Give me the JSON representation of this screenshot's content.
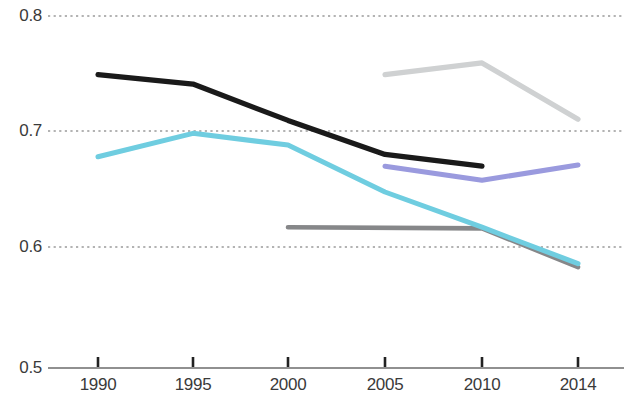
{
  "chart_data": {
    "type": "line",
    "title": "",
    "subtitle": "",
    "xlabel": "",
    "ylabel": "",
    "x": [
      1990,
      1995,
      2000,
      2005,
      2010,
      2014
    ],
    "categories": [
      "1990",
      "1995",
      "2000",
      "2005",
      "2010",
      "2014"
    ],
    "ylim": [
      0.5,
      0.8
    ],
    "xlim": [
      1990,
      2014
    ],
    "ytick_labels": [
      "0.8",
      "0.7",
      "0.6",
      "0.5"
    ],
    "ytick_values": [
      0.8,
      0.7,
      0.6,
      0.5
    ],
    "xtick_labels": [
      "1990",
      "1995",
      "2000",
      "2005",
      "2010",
      "2014"
    ],
    "grid": "horizontal-dotted",
    "gridlines_at": [
      0.8,
      0.7,
      0.6
    ],
    "legend": "none",
    "legend_position": "none",
    "annotations": [],
    "series": [
      {
        "name": "black-series",
        "color": "#1a1a1a",
        "x": [
          1990,
          1995,
          2000,
          2005,
          2010
        ],
        "values": [
          0.75,
          0.742,
          0.711,
          0.682,
          0.672
        ]
      },
      {
        "name": "cyan-series",
        "color": "#6fcde0",
        "x": [
          1990,
          1995,
          2000,
          2005,
          2010,
          2014
        ],
        "values": [
          0.68,
          0.7,
          0.69,
          0.65,
          0.62,
          0.589
        ]
      },
      {
        "name": "light-gray-series",
        "color": "#cfd1d2",
        "x": [
          2005,
          2010,
          2014
        ],
        "values": [
          0.75,
          0.76,
          0.712
        ]
      },
      {
        "name": "purple-series",
        "color": "#9a9ade",
        "x": [
          2005,
          2010,
          2014
        ],
        "values": [
          0.672,
          0.66,
          0.673
        ]
      },
      {
        "name": "dark-gray-series",
        "color": "#868789",
        "x": [
          2000,
          2010,
          2014
        ],
        "values": [
          0.62,
          0.619,
          0.586
        ]
      }
    ],
    "axis_color": "#555555",
    "grid_color": "#9a9a9a",
    "tick_color": "#333333",
    "background": "#ffffff"
  }
}
